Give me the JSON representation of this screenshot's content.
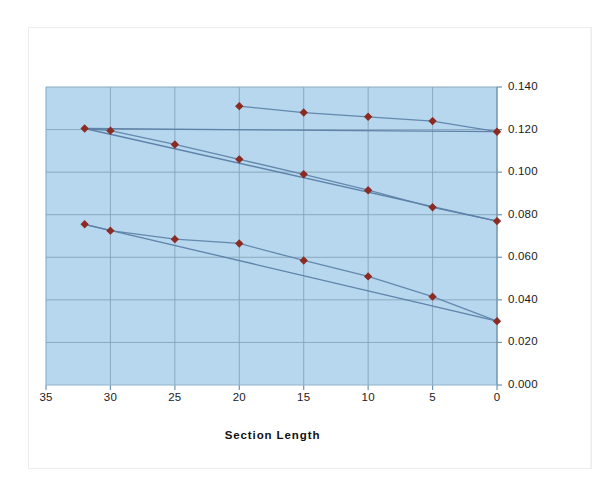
{
  "chart_data": {
    "type": "line",
    "title": "",
    "xlabel": "Section Length",
    "ylabel": "Strip Dimension",
    "grid": true,
    "legend": "none",
    "xlim": [
      35,
      0
    ],
    "ylim": [
      0.0,
      0.14
    ],
    "x_ticks": [
      "35",
      "30",
      "25",
      "20",
      "15",
      "10",
      "5",
      "0"
    ],
    "x_tick_values": [
      35,
      30,
      25,
      20,
      15,
      10,
      5,
      0
    ],
    "y_ticks": [
      "0.000",
      "0.020",
      "0.040",
      "0.060",
      "0.080",
      "0.100",
      "0.120",
      "0.140"
    ],
    "y_tick_values": [
      0.0,
      0.02,
      0.04,
      0.06,
      0.08,
      0.1,
      0.12,
      0.14
    ],
    "x_axis_reversed": true,
    "series": [
      {
        "name": "Series 1",
        "x": [
          20,
          15,
          10,
          5,
          0
        ],
        "values": [
          0.131,
          0.128,
          0.126,
          0.124,
          0.119
        ]
      },
      {
        "name": "Series 2",
        "x": [
          32,
          30,
          25,
          20,
          15,
          10,
          5,
          0
        ],
        "values": [
          0.1205,
          0.1195,
          0.113,
          0.106,
          0.099,
          0.0915,
          0.0835,
          0.077
        ]
      },
      {
        "name": "Series 3",
        "x": [
          32,
          30,
          25,
          20,
          15,
          10,
          5,
          0
        ],
        "values": [
          0.0755,
          0.0725,
          0.0685,
          0.0665,
          0.0585,
          0.051,
          0.0415,
          0.03
        ]
      }
    ],
    "trend_lines": [
      {
        "name": "Trend 1",
        "x0": 32,
        "y0": 0.1205,
        "x1": 0,
        "y1": 0.119
      },
      {
        "name": "Trend 2",
        "x0": 32,
        "y0": 0.1205,
        "x1": 0,
        "y1": 0.077
      },
      {
        "name": "Trend 3",
        "x0": 32,
        "y0": 0.0755,
        "x1": 0,
        "y1": 0.03
      }
    ],
    "colors": {
      "plot_background": "#b6d7ee",
      "gridline": "#8aa7bd",
      "marker": "#8c2b22",
      "series_line": "#5b7fa6",
      "axis": "#6f93b2",
      "text": "#1a1a1a"
    }
  }
}
